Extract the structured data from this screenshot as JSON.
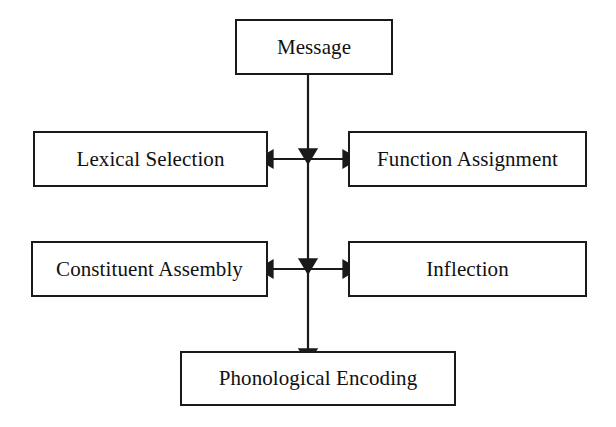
{
  "diagram": {
    "type": "flowchart",
    "stroke_color": "#1a1a1a",
    "background_color": "#ffffff",
    "text_color": "#111111",
    "nodes": [
      {
        "id": "message",
        "label": "Message",
        "row": 1,
        "column": "center"
      },
      {
        "id": "lexical",
        "label": "Lexical Selection",
        "row": 2,
        "column": "left"
      },
      {
        "id": "function",
        "label": "Function Assignment",
        "row": 2,
        "column": "right"
      },
      {
        "id": "constituent",
        "label": "Constituent Assembly",
        "row": 3,
        "column": "left"
      },
      {
        "id": "inflection",
        "label": "Inflection",
        "row": 3,
        "column": "right"
      },
      {
        "id": "phonological",
        "label": "Phonological Encoding",
        "row": 4,
        "column": "center"
      }
    ],
    "connectors": [
      {
        "id": "message-to-level1",
        "from": "message",
        "to": "level-1-junction",
        "direction": "down",
        "arrowheads": "end"
      },
      {
        "id": "lexical-function-link",
        "from": "lexical",
        "to": "function",
        "direction": "horizontal",
        "arrowheads": "both"
      },
      {
        "id": "level1-to-level2",
        "from": "level-1-junction",
        "to": "level-2-junction",
        "direction": "down",
        "arrowheads": "end"
      },
      {
        "id": "constituent-inflection-link",
        "from": "constituent",
        "to": "inflection",
        "direction": "horizontal",
        "arrowheads": "both"
      },
      {
        "id": "level2-to-phonological",
        "from": "level-2-junction",
        "to": "phonological",
        "direction": "down",
        "arrowheads": "end"
      }
    ]
  }
}
